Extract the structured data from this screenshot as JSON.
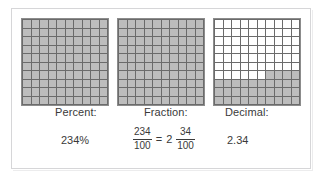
{
  "diagram": {
    "title_visible": false,
    "colors": {
      "shaded_cell": "#bdbdbd",
      "empty_cell": "#ffffff",
      "grid_line": "#6b6b6b",
      "frame_border": "#d6d6d8",
      "text": "#3a3a3a"
    },
    "columns": [
      {
        "label": "Percent:",
        "value": "234%",
        "grid_name": "hundredths-grid-full-1",
        "shaded_cells": 100,
        "total_cells": 100
      },
      {
        "label": "Fraction:",
        "value": "234/100 = 2 34/100",
        "grid_name": "hundredths-grid-full-2",
        "shaded_cells": 100,
        "total_cells": 100,
        "fraction": {
          "numerator": "234",
          "denominator": "100",
          "equals": "=",
          "whole_number": "2",
          "mixed_numerator": "34",
          "mixed_denominator": "100"
        }
      },
      {
        "label": "Decimal:",
        "value": "2.34",
        "grid_name": "hundredths-grid-partial-34",
        "shaded_cells": 34,
        "total_cells": 100
      }
    ]
  },
  "grid_fill": {
    "grid_1": [
      [
        1,
        1,
        1,
        1,
        1,
        1,
        1,
        1,
        1,
        1
      ],
      [
        1,
        1,
        1,
        1,
        1,
        1,
        1,
        1,
        1,
        1
      ],
      [
        1,
        1,
        1,
        1,
        1,
        1,
        1,
        1,
        1,
        1
      ],
      [
        1,
        1,
        1,
        1,
        1,
        1,
        1,
        1,
        1,
        1
      ],
      [
        1,
        1,
        1,
        1,
        1,
        1,
        1,
        1,
        1,
        1
      ],
      [
        1,
        1,
        1,
        1,
        1,
        1,
        1,
        1,
        1,
        1
      ],
      [
        1,
        1,
        1,
        1,
        1,
        1,
        1,
        1,
        1,
        1
      ],
      [
        1,
        1,
        1,
        1,
        1,
        1,
        1,
        1,
        1,
        1
      ],
      [
        1,
        1,
        1,
        1,
        1,
        1,
        1,
        1,
        1,
        1
      ],
      [
        1,
        1,
        1,
        1,
        1,
        1,
        1,
        1,
        1,
        1
      ]
    ],
    "grid_2": [
      [
        1,
        1,
        1,
        1,
        1,
        1,
        1,
        1,
        1,
        1
      ],
      [
        1,
        1,
        1,
        1,
        1,
        1,
        1,
        1,
        1,
        1
      ],
      [
        1,
        1,
        1,
        1,
        1,
        1,
        1,
        1,
        1,
        1
      ],
      [
        1,
        1,
        1,
        1,
        1,
        1,
        1,
        1,
        1,
        1
      ],
      [
        1,
        1,
        1,
        1,
        1,
        1,
        1,
        1,
        1,
        1
      ],
      [
        1,
        1,
        1,
        1,
        1,
        1,
        1,
        1,
        1,
        1
      ],
      [
        1,
        1,
        1,
        1,
        1,
        1,
        1,
        1,
        1,
        1
      ],
      [
        1,
        1,
        1,
        1,
        1,
        1,
        1,
        1,
        1,
        1
      ],
      [
        1,
        1,
        1,
        1,
        1,
        1,
        1,
        1,
        1,
        1
      ],
      [
        1,
        1,
        1,
        1,
        1,
        1,
        1,
        1,
        1,
        1
      ]
    ],
    "grid_3": [
      [
        0,
        0,
        0,
        0,
        0,
        0,
        0,
        0,
        0,
        0
      ],
      [
        0,
        0,
        0,
        0,
        0,
        0,
        0,
        0,
        0,
        0
      ],
      [
        0,
        0,
        0,
        0,
        0,
        0,
        0,
        0,
        0,
        0
      ],
      [
        0,
        0,
        0,
        0,
        0,
        0,
        0,
        0,
        0,
        0
      ],
      [
        0,
        0,
        0,
        0,
        0,
        0,
        0,
        0,
        0,
        0
      ],
      [
        0,
        0,
        0,
        0,
        0,
        0,
        0,
        0,
        0,
        0
      ],
      [
        0,
        0,
        0,
        0,
        0,
        0,
        1,
        1,
        1,
        1
      ],
      [
        1,
        1,
        1,
        1,
        1,
        1,
        1,
        1,
        1,
        1
      ],
      [
        1,
        1,
        1,
        1,
        1,
        1,
        1,
        1,
        1,
        1
      ],
      [
        1,
        1,
        1,
        1,
        1,
        1,
        1,
        1,
        1,
        1
      ]
    ]
  }
}
